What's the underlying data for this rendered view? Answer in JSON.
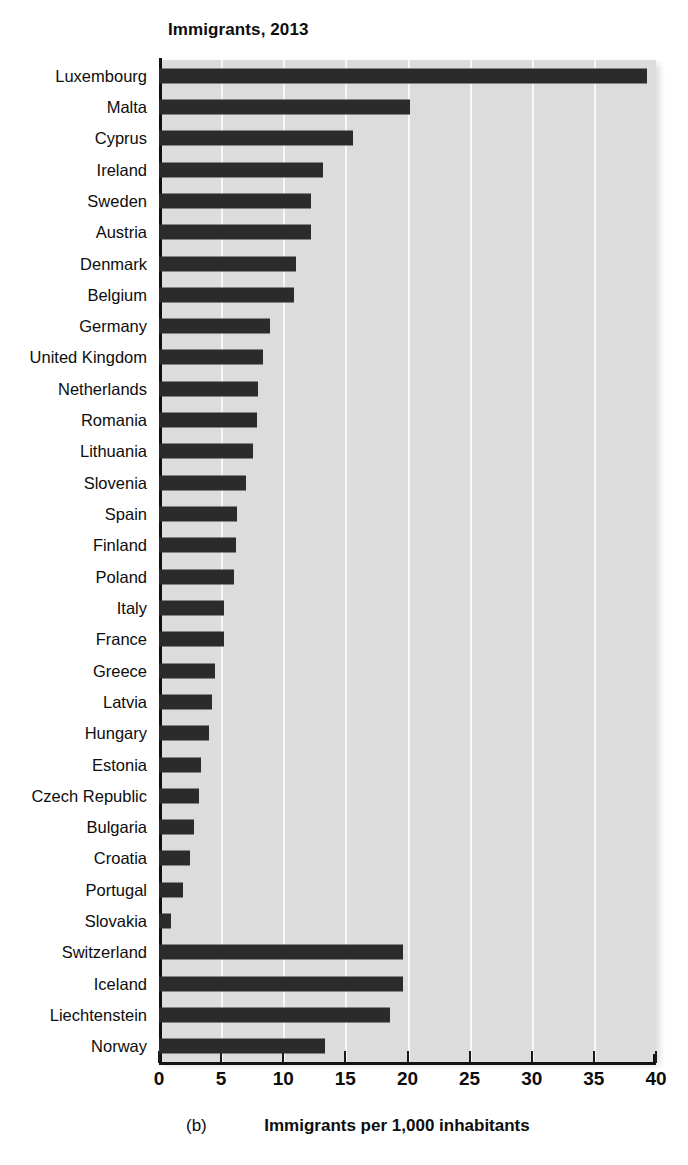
{
  "figure": {
    "panel_tag": "(b)",
    "title": "Immigrants, 2013",
    "axis_title": "Immigrants per 1,000 inhabitants"
  },
  "chart_data": {
    "type": "bar",
    "orientation": "horizontal",
    "title": "Immigrants, 2013",
    "xlabel": "Immigrants per 1,000 inhabitants",
    "ylabel": "",
    "xlim": [
      0,
      40
    ],
    "xticks": [
      0,
      5,
      10,
      15,
      20,
      25,
      30,
      35,
      40
    ],
    "grid": "vertical",
    "legend": "none",
    "bar_color": "#2b2b2b",
    "plot_background": "#dcdcdc",
    "categories": [
      "Luxembourg",
      "Malta",
      "Cyprus",
      "Ireland",
      "Sweden",
      "Austria",
      "Denmark",
      "Belgium",
      "Germany",
      "United Kingdom",
      "Netherlands",
      "Romania",
      "Lithuania",
      "Slovenia",
      "Spain",
      "Finland",
      "Poland",
      "Italy",
      "France",
      "Greece",
      "Latvia",
      "Hungary",
      "Estonia",
      "Czech Republic",
      "Bulgaria",
      "Croatia",
      "Portugal",
      "Slovakia",
      "Switzerland",
      "Iceland",
      "Liechtenstein",
      "Norway"
    ],
    "values": [
      39.3,
      20.2,
      15.6,
      13.2,
      12.2,
      12.2,
      11.0,
      10.9,
      8.9,
      8.4,
      8.0,
      7.9,
      7.6,
      7.0,
      6.3,
      6.2,
      6.0,
      5.2,
      5.2,
      4.5,
      4.3,
      4.0,
      3.4,
      3.2,
      2.8,
      2.5,
      1.9,
      1.0,
      19.6,
      19.6,
      18.6,
      13.4
    ],
    "group_break_after": "Slovakia",
    "group_note": "Last four categories (Switzerland, Iceland, Liechtenstein, Norway) form a separate non-EU group"
  }
}
